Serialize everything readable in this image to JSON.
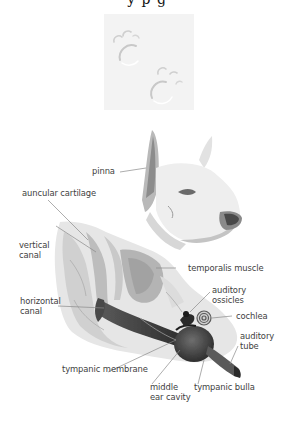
{
  "header": {
    "cut_off_title": "y p  g",
    "note": ""
  },
  "paw_tile": {
    "icon": "paw-prints-icon",
    "background": "#f3f3f3"
  },
  "diagram": {
    "labels": {
      "pinna": "pinna",
      "auricular_cartilage": "auncular cartilage",
      "vertical_canal_1": "vertical",
      "vertical_canal_2": "canal",
      "temporalis_muscle": "temporalis muscle",
      "horizontal_canal_1": "horizontal",
      "horizontal_canal_2": "canal",
      "auditory_ossicles_1": "auditory",
      "auditory_ossicles_2": "ossicles",
      "cochlea": "cochlea",
      "auditory_tube_1": "auditory",
      "auditory_tube_2": "tube",
      "tympanic_membrane": "tympanic membrane",
      "middle_ear_cavity_1": "middle",
      "middle_ear_cavity_2": "ear cavity",
      "tympanic_bulla": "tympanic bulla"
    },
    "colors": {
      "label_text": "#3e3e3e",
      "leader_line": "#8a8a8a",
      "sketch_dark": "#3a3a3a",
      "sketch_mid": "#9a9a9a",
      "sketch_light": "#d4d4d4"
    }
  }
}
